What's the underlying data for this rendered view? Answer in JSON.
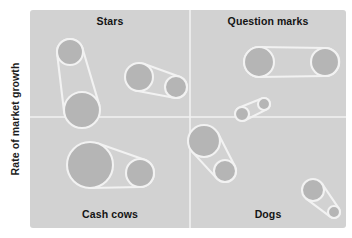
{
  "axes": {
    "y_label": "Rate of market growth"
  },
  "quadrants": [
    {
      "id": "stars",
      "label": "Stars",
      "position": "top-left"
    },
    {
      "id": "question-marks",
      "label": "Question marks",
      "position": "top-right"
    },
    {
      "id": "cash-cows",
      "label": "Cash cows",
      "position": "bottom-left"
    },
    {
      "id": "dogs",
      "label": "Dogs",
      "position": "bottom-right"
    }
  ],
  "colors": {
    "panel_background": "#d2d2d2",
    "bubble_fill": "#b5b5b5",
    "bubble_outline": "#f2f2f2",
    "divider": "#f2f2f2",
    "text": "#141414",
    "page_background": "#ffffff"
  },
  "chart_data": {
    "type": "scatter",
    "title": "",
    "xlabel": "",
    "ylabel": "Rate of market growth",
    "grid": false,
    "legend": "none",
    "divider_x": 190,
    "divider_y": 117,
    "quadrant_names": [
      "Stars",
      "Question marks",
      "Cash cows",
      "Dogs"
    ],
    "note": "BCG growth-share matrix. Bubbles are grouped in pairs joined by tangent connector outlines; bubble radius encodes relative business size.",
    "groups": [
      {
        "quadrant": "stars",
        "bubbles": [
          {
            "cx": 70,
            "cy": 52,
            "r": 13
          },
          {
            "cx": 82,
            "cy": 110,
            "r": 18
          }
        ]
      },
      {
        "quadrant": "stars",
        "bubbles": [
          {
            "cx": 139,
            "cy": 77,
            "r": 14
          },
          {
            "cx": 176,
            "cy": 87,
            "r": 11
          }
        ]
      },
      {
        "quadrant": "cash-cows",
        "bubbles": [
          {
            "cx": 90,
            "cy": 165,
            "r": 23
          },
          {
            "cx": 140,
            "cy": 173,
            "r": 14
          }
        ]
      },
      {
        "quadrant": "question-marks",
        "bubbles": [
          {
            "cx": 259,
            "cy": 62,
            "r": 15
          },
          {
            "cx": 325,
            "cy": 62,
            "r": 14
          }
        ]
      },
      {
        "quadrant": "question-marks",
        "bubbles": [
          {
            "cx": 242,
            "cy": 114,
            "r": 7
          },
          {
            "cx": 264,
            "cy": 104,
            "r": 6
          }
        ]
      },
      {
        "quadrant": "dogs",
        "bubbles": [
          {
            "cx": 204,
            "cy": 141,
            "r": 16
          },
          {
            "cx": 225,
            "cy": 171,
            "r": 11
          }
        ]
      },
      {
        "quadrant": "dogs",
        "bubbles": [
          {
            "cx": 313,
            "cy": 190,
            "r": 11
          },
          {
            "cx": 334,
            "cy": 212,
            "r": 6
          }
        ]
      }
    ]
  }
}
